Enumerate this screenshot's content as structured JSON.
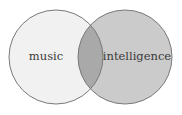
{
  "diagram": {
    "type": "venn",
    "sets": [
      {
        "id": "music",
        "label": "music",
        "center": [
          56,
          57
        ],
        "radius": 47,
        "fill": "#f1f1f1"
      },
      {
        "id": "intelligence",
        "label": "intelligence",
        "center": [
          125,
          57
        ],
        "radius": 47,
        "fill": "#cbcbcb"
      }
    ],
    "overlap_fill": "#a9a9a9",
    "stroke": "#7a7a7a",
    "background": "#ffffff"
  }
}
